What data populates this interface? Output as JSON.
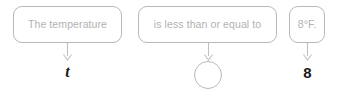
{
  "worksheet": {
    "title": "Translate the sentence into an inequality",
    "phrase_boxes": [
      {
        "id": "subject",
        "text": "The temperature"
      },
      {
        "id": "relation",
        "text": "is less than or equal to"
      },
      {
        "id": "value",
        "text": "8°F."
      }
    ],
    "arrows": [
      {
        "id": "arrow-subject",
        "icon": "down-arrow-icon"
      },
      {
        "id": "arrow-relation",
        "icon": "down-arrow-icon"
      },
      {
        "id": "arrow-value",
        "icon": "down-arrow-icon"
      }
    ],
    "answers": [
      {
        "id": "variable",
        "text": "t",
        "shape": "plain"
      },
      {
        "id": "operator",
        "text": "",
        "shape": "circle"
      },
      {
        "id": "number",
        "text": "8",
        "shape": "plain"
      }
    ],
    "colors": {
      "box_border": "#b9b9b9",
      "box_text": "#b2b2b2",
      "answer_text": "#1a1a1a",
      "arrow": "#c0c0c0",
      "background": "#ffffff"
    }
  }
}
